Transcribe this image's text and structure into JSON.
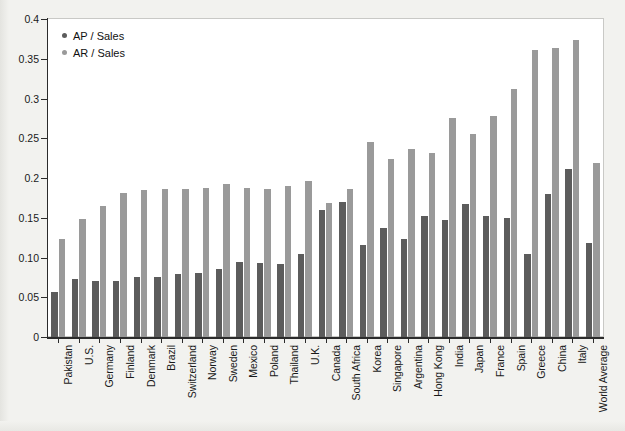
{
  "chart_data": {
    "type": "bar",
    "title": "",
    "xlabel": "",
    "ylabel": "",
    "ylim": [
      0,
      0.4
    ],
    "grid": false,
    "legend_position": "top-left",
    "ytick_labels": [
      "0.4",
      "0.35",
      "0.3",
      "0.25",
      "0.2",
      "0.15",
      "0.10",
      "0.05",
      "0"
    ],
    "ytick_values": [
      0.4,
      0.35,
      0.3,
      0.25,
      0.2,
      0.15,
      0.1,
      0.05,
      0
    ],
    "categories": [
      "Pakistan",
      "U.S.",
      "Germany",
      "Finland",
      "Denmark",
      "Brazil",
      "Switzerland",
      "Norway",
      "Sweden",
      "Mexico",
      "Poland",
      "Thailand",
      "U.K.",
      "Canada",
      "South Africa",
      "Korea",
      "Singapore",
      "Argentina",
      "Hong Kong",
      "India",
      "Japan",
      "France",
      "Spain",
      "Greece",
      "China",
      "Italy",
      "World Average"
    ],
    "series": [
      {
        "name": "AP / Sales",
        "color": "#5c5c5c",
        "values": [
          0.057,
          0.073,
          0.07,
          0.07,
          0.075,
          0.075,
          0.079,
          0.081,
          0.085,
          0.094,
          0.093,
          0.092,
          0.104,
          0.16,
          0.17,
          0.116,
          0.137,
          0.123,
          0.152,
          0.147,
          0.167,
          0.152,
          0.15,
          0.105,
          0.18,
          0.211,
          0.118
        ]
      },
      {
        "name": "AR / Sales",
        "color": "#9a9a9a",
        "values": [
          0.123,
          0.148,
          0.165,
          0.181,
          0.185,
          0.186,
          0.186,
          0.188,
          0.192,
          0.188,
          0.186,
          0.19,
          0.196,
          0.169,
          0.186,
          0.245,
          0.224,
          0.237,
          0.232,
          0.275,
          0.255,
          0.278,
          0.312,
          0.361,
          0.363,
          0.373,
          0.219
        ]
      }
    ]
  },
  "legend": {
    "items": [
      {
        "label": "AP / Sales"
      },
      {
        "label": "AR / Sales"
      }
    ]
  }
}
